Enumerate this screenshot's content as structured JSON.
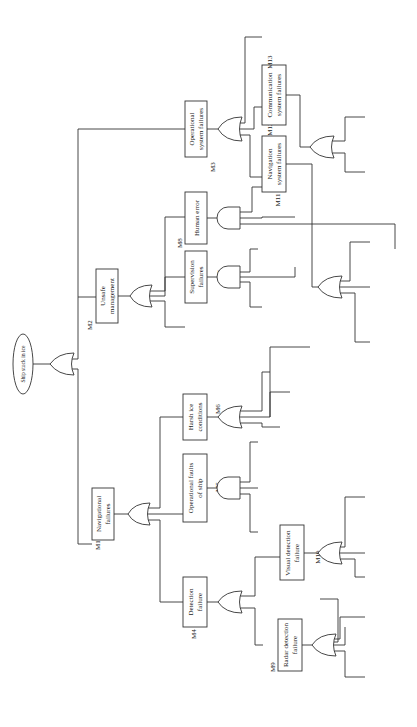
{
  "diagram": {
    "top_event": "Ship stuck in ice",
    "intermediate": {
      "M1": {
        "id": "M1",
        "label_l1": "Navigational",
        "label_l2": "failures"
      },
      "M2": {
        "id": "M2",
        "label_l1": "Unsafe",
        "label_l2": "management"
      },
      "M3": {
        "id": "M3",
        "label_l1": "Operational",
        "label_l2": "system failures"
      },
      "M4": {
        "id": "M4",
        "label_l1": "Detection",
        "label_l2": "failure"
      },
      "M5": {
        "id": "M5",
        "label_l1": "Operational faults",
        "label_l2": "of ship"
      },
      "M6": {
        "id": "M6",
        "label_l1": "Harsh ice",
        "label_l2": "conditions"
      },
      "M7": {
        "id": "M7",
        "label_l1": "Supervision",
        "label_l2": "failures"
      },
      "M8": {
        "id": "M8",
        "label_l1": "Human error",
        "label_l2": ""
      },
      "M9": {
        "id": "M9",
        "label_l1": "Radar detection",
        "label_l2": "failure"
      },
      "M10": {
        "id": "M10",
        "label_l1": "Visual detection",
        "label_l2": "failure"
      },
      "M11": {
        "id": "M11",
        "label_l1": "Navigation",
        "label_l2": "system failures"
      },
      "M12": {
        "id": "M12",
        "label_l1": "Communication",
        "label_l2": "system failures"
      },
      "M13": {
        "id": "M13",
        "label_l1": "Emergency",
        "label_l2": "operational faults"
      }
    },
    "basic_events": {
      "ice_density_error": [
        "Ice density",
        "measurement",
        "error"
      ],
      "position_estimate_error": [
        "Position estimate",
        "error"
      ],
      "predicted_trajectory": [
        "Predicted",
        "trajectory of ice",
        "flow"
      ],
      "bad_visibility": [
        "Bad visibility"
      ],
      "snow_rain": [
        "Snow or rain",
        "weather"
      ],
      "strong_winds": [
        "Strong winds"
      ],
      "negligence": [
        "Negligence"
      ],
      "wrong_course": [
        "Wrong of the",
        "course of ship"
      ],
      "maneuver_failures": [
        "Maneuver",
        "failures"
      ],
      "ice_condition": [
        "Ice condition"
      ],
      "ice_flow": [
        "Ice flow"
      ],
      "high_ice_density": [
        "High ice density"
      ],
      "ice_ridge": [
        "Ice ridge"
      ],
      "improper_route": [
        "Improper route",
        "selection"
      ],
      "low_speed": [
        "Low speed"
      ],
      "deviation_route": [
        "Deviation from",
        "suggested route"
      ],
      "judgement_failures": [
        "Judgement",
        "failures"
      ],
      "lack_situational": [
        "Lack of",
        "situational",
        "awareness"
      ],
      "failure_propulsion": [
        "Failure of",
        "propulsion"
      ],
      "engine_failure": [
        "Engine failure"
      ],
      "steering_gear": [
        "Steering gear",
        "failures"
      ],
      "mechanical_failures": [
        "Mechanical",
        "failures"
      ],
      "software_malfunction": [
        "Software",
        "malfunction"
      ],
      "lack_icebreaking": [
        "Lack of",
        "icebreaking",
        "ability"
      ],
      "lack_emergency": [
        "Lack of",
        "emergency",
        "operation"
      ],
      "lack_engine_power": [
        "Lack of engine",
        "power"
      ]
    }
  }
}
